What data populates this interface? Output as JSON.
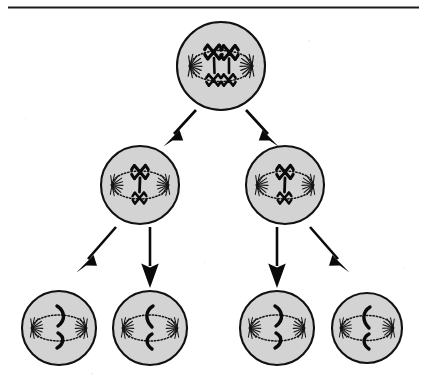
{
  "figure": {
    "header_rule": {
      "present": true,
      "color": "#1c1c1c",
      "y": 7
    },
    "cropped_caption_text": "",
    "background_color": "#ffffff",
    "cell_fill_color": "#d3d3d3",
    "cell_outline_color": "#111111",
    "chromosome_color": "#0a0a0a",
    "arrow_color": "#0a0a0a"
  },
  "generations": [
    {
      "id": "generation-1",
      "label": "Parent cell",
      "cell_count": 1,
      "chromosome_state": "four chromosomes aligned at metaphase plate",
      "cells": [
        {
          "id": "parent-cell",
          "name": "parent-cell",
          "cx": 221,
          "cy": 66,
          "r": 44,
          "chromosome_count": 4,
          "chromosome_shape": "x-shaped",
          "arrangement": "two pairs stacked at equator"
        }
      ]
    },
    {
      "id": "generation-2",
      "label": "Daughter cells",
      "cell_count": 2,
      "chromosome_state": "two chromosomes per cell",
      "cells": [
        {
          "id": "daughter-cell-left",
          "name": "daughter-cell-left",
          "cx": 140,
          "cy": 185,
          "r": 39,
          "chromosome_count": 2,
          "chromosome_shape": "x-shaped",
          "arrangement": "one above and one below equator"
        },
        {
          "id": "daughter-cell-right",
          "name": "daughter-cell-right",
          "cx": 285,
          "cy": 185,
          "r": 39,
          "chromosome_count": 2,
          "chromosome_shape": "x-shaped",
          "arrangement": "one above and one below equator"
        }
      ]
    },
    {
      "id": "generation-3",
      "label": "Gamete cells",
      "cell_count": 4,
      "chromosome_state": "single chromatid per cell",
      "cells": [
        {
          "id": "gamete-cell-1",
          "name": "gamete-cell-1",
          "cx": 59,
          "cy": 328,
          "r": 37,
          "chromosome_count": 1,
          "chromosome_shape": "curved-chromatid-right",
          "arrangement": "split across equator"
        },
        {
          "id": "gamete-cell-2",
          "name": "gamete-cell-2",
          "cx": 150,
          "cy": 328,
          "r": 37,
          "chromosome_count": 1,
          "chromosome_shape": "curved-chromatid-left",
          "arrangement": "split across equator"
        },
        {
          "id": "gamete-cell-3",
          "name": "gamete-cell-3",
          "cx": 277,
          "cy": 328,
          "r": 37,
          "chromosome_count": 1,
          "chromosome_shape": "curved-chromatid-right",
          "arrangement": "split across equator"
        },
        {
          "id": "gamete-cell-4",
          "name": "gamete-cell-4",
          "cx": 367,
          "cy": 328,
          "r": 35,
          "chromosome_count": 1,
          "chromosome_shape": "curved-chromatid-left",
          "arrangement": "split across equator"
        }
      ]
    }
  ],
  "arrows": [
    {
      "id": "arrow-parent-to-left",
      "name": "arrow-parent-to-daughter-left",
      "from": "parent-cell",
      "to": "daughter-cell-left",
      "direction": "down-left"
    },
    {
      "id": "arrow-parent-to-right",
      "name": "arrow-parent-to-daughter-right",
      "from": "parent-cell",
      "to": "daughter-cell-right",
      "direction": "down-right"
    },
    {
      "id": "arrow-left-to-g1",
      "name": "arrow-daughter-left-to-gamete-1",
      "from": "daughter-cell-left",
      "to": "gamete-cell-1",
      "direction": "down-left"
    },
    {
      "id": "arrow-left-to-g2",
      "name": "arrow-daughter-left-to-gamete-2",
      "from": "daughter-cell-left",
      "to": "gamete-cell-2",
      "direction": "down"
    },
    {
      "id": "arrow-right-to-g3",
      "name": "arrow-daughter-right-to-gamete-3",
      "from": "daughter-cell-right",
      "to": "gamete-cell-3",
      "direction": "down"
    },
    {
      "id": "arrow-right-to-g4",
      "name": "arrow-daughter-right-to-gamete-4",
      "from": "daughter-cell-right",
      "to": "gamete-cell-4",
      "direction": "down-right"
    }
  ]
}
